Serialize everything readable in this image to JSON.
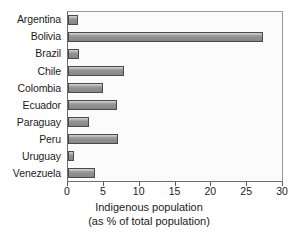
{
  "chart_data": {
    "type": "bar",
    "orientation": "horizontal",
    "title": "",
    "xlabel": "Indigenous population (as % of total population)",
    "ylabel": "",
    "xlim": [
      0,
      30
    ],
    "xticks": [
      0,
      5,
      10,
      15,
      20,
      25,
      30
    ],
    "grid": false,
    "legend": null,
    "categories": [
      "Argentina",
      "Bolivia",
      "Brazil",
      "Chile",
      "Colombia",
      "Ecuador",
      "Paraguay",
      "Peru",
      "Uruguay",
      "Venezuela"
    ],
    "values": [
      1.4,
      27.4,
      1.5,
      7.8,
      4.9,
      6.8,
      3.0,
      7.0,
      0.9,
      3.8
    ],
    "units": "% of total population"
  },
  "axis_title": {
    "line1": "Indigenous population",
    "line2": "(as % of total population)"
  },
  "colors": {
    "bar_fill": "#8a8a8a",
    "bar_highlight": "#c9c9c9",
    "bar_outline": "#4a4a4a",
    "plot_background": "#fbfbfb",
    "frame": "#6d6d6d",
    "text": "#1b1b1b"
  }
}
